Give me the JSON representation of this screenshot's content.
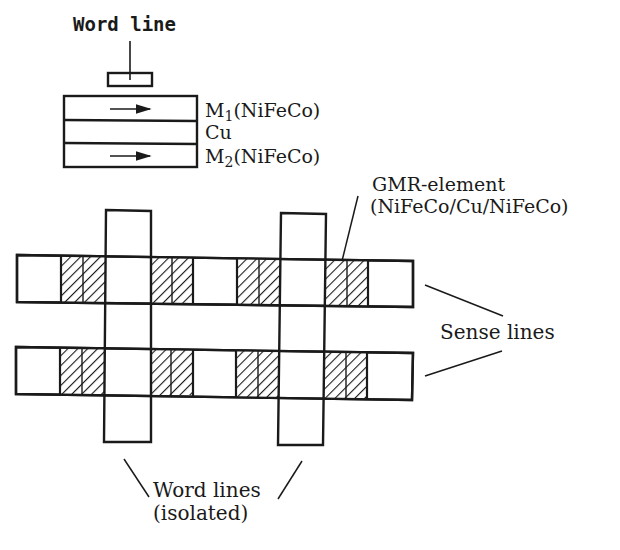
{
  "stack": {
    "word_line_label": "Word line",
    "layers": [
      {
        "label_main": "M",
        "label_sub": "1",
        "label_rest": "(NiFeCo)",
        "magnetization": "right"
      },
      {
        "label": "Cu"
      },
      {
        "label_main": "M",
        "label_sub": "2",
        "label_rest": "(NiFeCo)",
        "magnetization": "right"
      }
    ]
  },
  "array": {
    "gmr_label_line1": "GMR-element",
    "gmr_label_line2": "(NiFeCo/Cu/NiFeCo)",
    "sense_lines_label": "Sense lines",
    "word_lines_label_line1": "Word lines",
    "word_lines_label_line2": "(isolated)",
    "sense_line_count": 2,
    "word_line_count": 2,
    "gmr_elements_per_sense_line": 4
  },
  "colors": {
    "ink": "#1a1a1a",
    "background": "#ffffff"
  }
}
